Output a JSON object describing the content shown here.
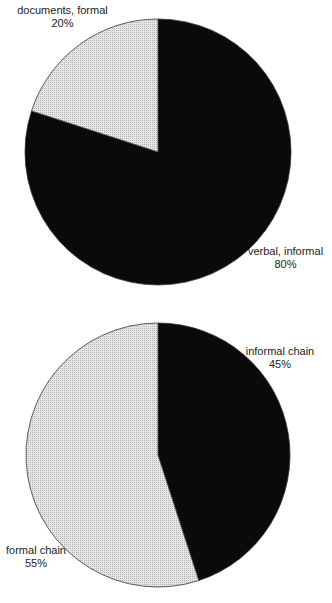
{
  "chart_data": [
    {
      "type": "pie",
      "title": "",
      "slices": [
        {
          "label": "verbal, informal",
          "value": 80,
          "display": "80%",
          "fill": "#0a0a0a"
        },
        {
          "label": "documents, formal",
          "value": 20,
          "display": "20%",
          "fill": "#d6d6d6"
        }
      ],
      "start_angle_deg": 0,
      "direction": "clockwise"
    },
    {
      "type": "pie",
      "title": "",
      "slices": [
        {
          "label": "informal chain",
          "value": 45,
          "display": "45%",
          "fill": "#0a0a0a"
        },
        {
          "label": "formal chain",
          "value": 55,
          "display": "55%",
          "fill": "#d6d6d6"
        }
      ],
      "start_angle_deg": 0,
      "direction": "clockwise"
    }
  ]
}
